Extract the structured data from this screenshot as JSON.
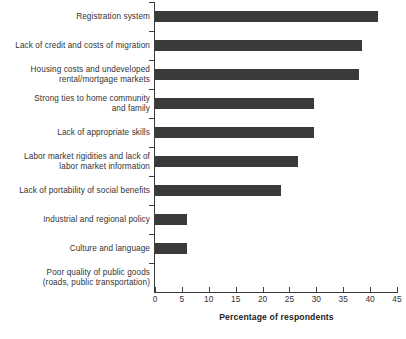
{
  "chart_data": {
    "type": "bar",
    "orientation": "horizontal",
    "title": "",
    "xlabel": "Percentage of respondents",
    "ylabel": "",
    "xlim": [
      0,
      45
    ],
    "xticks": [
      0,
      5,
      10,
      15,
      20,
      25,
      30,
      35,
      40,
      45
    ],
    "grid": false,
    "legend": null,
    "bar_color": "#3a3a3a",
    "axis_color": "#3c3c3c",
    "categories": [
      "Registration system",
      "Lack of credit and costs of migration",
      "Housing costs and undeveloped\nrental/mortgage markets",
      "Strong ties to home community\nand family",
      "Lack of appropriate skills",
      "Labor market rigidities and lack of\nlabor market information",
      "Lack of portability of social benefits",
      "Industrial and regional policy",
      "Culture and language",
      "Poor quality of public goods\n(roads, public transportation)"
    ],
    "values": [
      41.5,
      38.5,
      38,
      29.5,
      29.5,
      26.5,
      23.5,
      6,
      6,
      0
    ]
  }
}
